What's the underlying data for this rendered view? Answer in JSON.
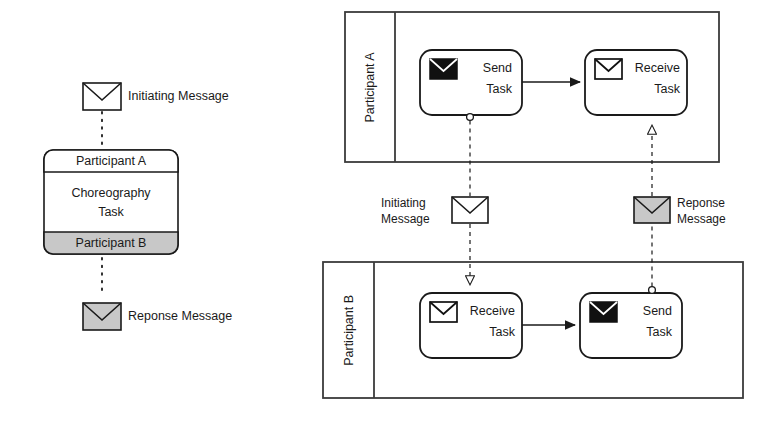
{
  "diagram": {
    "colors": {
      "stroke": "#1a1a1a",
      "pool_stroke": "#3b3b3b",
      "fill_white": "#ffffff",
      "fill_gray": "#c8c8c8",
      "fill_black": "#111111",
      "text": "#1a1a1a"
    }
  },
  "legend": {
    "initiating": {
      "label": "Initiating Message",
      "envelope_fill": "#ffffff",
      "icon": "envelope-icon"
    },
    "response": {
      "label": "Reponse Message",
      "envelope_fill": "#c8c8c8",
      "icon": "envelope-icon"
    },
    "choreography_task": {
      "participant_top": "Participant A",
      "task_name_line1": "Choreography",
      "task_name_line2": "Task",
      "participant_bottom": "Participant B",
      "top_band_fill": "#ffffff",
      "body_fill": "#ffffff",
      "bottom_band_fill": "#c8c8c8"
    }
  },
  "collaboration": {
    "pools": [
      {
        "name": "Participant A",
        "tasks": [
          {
            "line1": "Send",
            "line2": "Task",
            "type": "send-task",
            "icon": "envelope-filled-icon",
            "icon_fill": "#111111"
          },
          {
            "line1": "Receive",
            "line2": "Task",
            "type": "receive-task",
            "icon": "envelope-icon",
            "icon_fill": "#ffffff"
          }
        ]
      },
      {
        "name": "Participant B",
        "tasks": [
          {
            "line1": "Receive",
            "line2": "Task",
            "type": "receive-task",
            "icon": "envelope-icon",
            "icon_fill": "#ffffff"
          },
          {
            "line1": "Send",
            "line2": "Task",
            "type": "send-task",
            "icon": "envelope-filled-icon",
            "icon_fill": "#111111"
          }
        ]
      }
    ],
    "message_flows": [
      {
        "label_line1": "Initiating",
        "label_line2": "Message",
        "envelope_fill": "#ffffff",
        "direction": "down",
        "from": "Participant A / Send Task",
        "to": "Participant B / Receive Task"
      },
      {
        "label_line1": "Reponse",
        "label_line2": "Message",
        "envelope_fill": "#c8c8c8",
        "direction": "up",
        "from": "Participant B / Send Task",
        "to": "Participant A / Receive Task"
      }
    ]
  }
}
